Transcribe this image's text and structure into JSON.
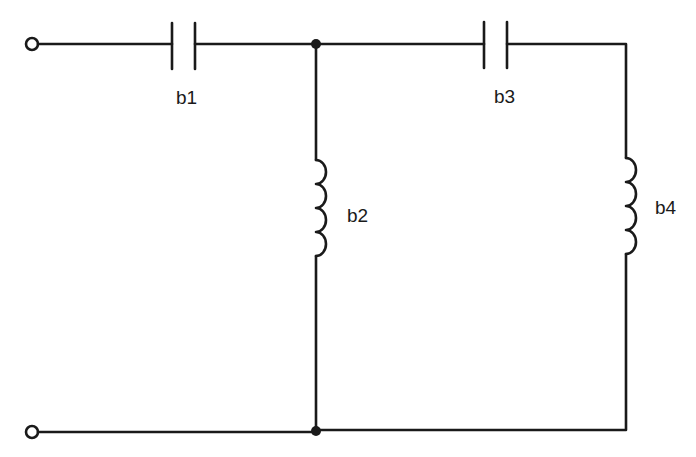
{
  "diagram": {
    "type": "circuit-schematic",
    "components": [
      {
        "id": "b1",
        "label": "b1",
        "kind": "capacitor",
        "branch": "series"
      },
      {
        "id": "b2",
        "label": "b2",
        "kind": "inductor",
        "branch": "shunt"
      },
      {
        "id": "b3",
        "label": "b3",
        "kind": "capacitor",
        "branch": "series"
      },
      {
        "id": "b4",
        "label": "b4",
        "kind": "inductor",
        "branch": "shunt"
      }
    ],
    "terminals": [
      "input-top",
      "input-bottom"
    ],
    "junctions": [
      "top-node",
      "bottom-node"
    ]
  }
}
